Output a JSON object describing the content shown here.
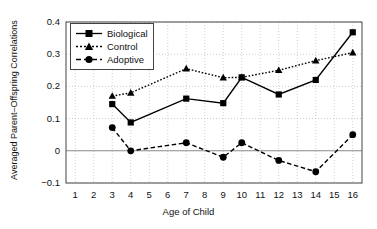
{
  "chart_data": {
    "type": "line",
    "title": "",
    "xlabel": "Age of Child",
    "ylabel": "Averaged Parent–Offspring Correlations",
    "x": [
      1,
      2,
      3,
      4,
      5,
      6,
      7,
      8,
      9,
      10,
      11,
      12,
      13,
      14,
      15,
      16
    ],
    "xticklabels": [
      "1",
      "2",
      "3",
      "4",
      "5",
      "6",
      "7",
      "8",
      "9",
      "10",
      "11",
      "12",
      "13",
      "14",
      "15",
      "16"
    ],
    "yticklabels": [
      "0.4",
      "0.3",
      "0.2",
      "0.1",
      "0",
      "−0.1"
    ],
    "yticks": [
      0.4,
      0.3,
      0.2,
      0.1,
      0,
      -0.1
    ],
    "xlim": [
      0.5,
      16.5
    ],
    "ylim": [
      -0.1,
      0.4
    ],
    "grid": true,
    "legend_position": "upper-left",
    "zero_line": 0,
    "series": [
      {
        "name": "Biological",
        "marker": "square",
        "linestyle": "solid",
        "color": "#000000",
        "x": [
          3,
          4,
          7,
          9,
          10,
          12,
          14,
          16
        ],
        "values": [
          0.145,
          0.088,
          0.162,
          0.148,
          0.228,
          0.175,
          0.22,
          0.368
        ]
      },
      {
        "name": "Control",
        "marker": "triangle",
        "linestyle": "dotted",
        "color": "#000000",
        "x": [
          3,
          4,
          7,
          9,
          10,
          12,
          14,
          16
        ],
        "values": [
          0.17,
          0.18,
          0.255,
          0.227,
          0.228,
          0.25,
          0.28,
          0.305
        ]
      },
      {
        "name": "Adoptive",
        "marker": "circle",
        "linestyle": "dashed",
        "color": "#000000",
        "x": [
          3,
          4,
          7,
          9,
          10,
          12,
          14,
          16
        ],
        "values": [
          0.072,
          0.0,
          0.025,
          -0.02,
          0.025,
          -0.03,
          -0.065,
          0.05
        ]
      }
    ]
  },
  "legend": {
    "items": [
      {
        "label": "Biological"
      },
      {
        "label": "Control"
      },
      {
        "label": "Adoptive"
      }
    ]
  }
}
